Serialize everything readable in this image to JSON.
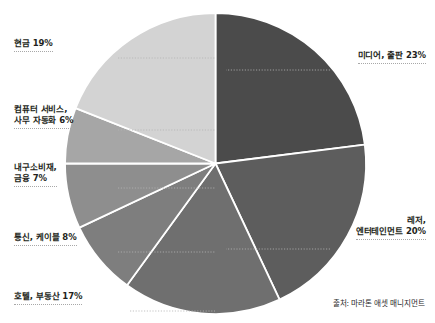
{
  "chart_data": {
    "type": "pie",
    "title": "",
    "subtitle": "",
    "xlabel": "",
    "ylabel": "",
    "legend_position": "callout-labels",
    "grid": false,
    "start_angle_deg": 0,
    "direction": "clockwise",
    "units": "percent",
    "categories": [
      "미디어, 출판",
      "레저, 엔터테인먼트",
      "호텔, 부동산",
      "통신, 케이블",
      "내구소비재, 금융",
      "컴퓨터 서비스, 사무 자동화",
      "현금"
    ],
    "values": [
      23,
      20,
      17,
      8,
      7,
      6,
      19
    ],
    "colors": [
      "#4b4b4b",
      "#5d5d5d",
      "#6f6f6f",
      "#7e7e7e",
      "#8e8e8e",
      "#a6a6a6",
      "#d3d3d3"
    ],
    "slice_separator_color": "#ffffff",
    "slices": [
      {
        "label": "미디어, 출판",
        "value": 23,
        "display": "미디어, 출판 23%",
        "color": "#4b4b4b"
      },
      {
        "label": "레저, 엔터테인먼트",
        "value": 20,
        "display": "레저, 엔터테인먼트 20%",
        "color": "#5d5d5d"
      },
      {
        "label": "호텔, 부동산",
        "value": 17,
        "display": "호텔, 부동산 17%",
        "color": "#6f6f6f"
      },
      {
        "label": "통신, 케이블",
        "value": 8,
        "display": "통신, 케이블 8%",
        "color": "#7e7e7e"
      },
      {
        "label": "내구소비재, 금융",
        "value": 7,
        "display": "내구소비재, 금융 7%",
        "color": "#8e8e8e"
      },
      {
        "label": "컴퓨터 서비스, 사무 자동화",
        "value": 6,
        "display": "컴퓨터 서비스, 사무 자동화 6%",
        "color": "#a6a6a6"
      },
      {
        "label": "현금",
        "value": 19,
        "display": "현금 19%",
        "color": "#d3d3d3"
      }
    ],
    "annotations": [
      "출처: 마라톤 애셋 매니지먼트"
    ]
  },
  "callouts": {
    "cash": {
      "line1": "현금 19%"
    },
    "computer_services": {
      "line1": "컴퓨터 서비스,",
      "line2": "사무 자동화 6%"
    },
    "durable_goods": {
      "line1": "내구소비재,",
      "line2": "금융 7%"
    },
    "telecom": {
      "line1": "통신, 케이블 8%"
    },
    "hotel_realestate": {
      "line1": "호텔, 부동산 17%"
    },
    "media_publishing": {
      "line1": "미디어, 출판 23%"
    },
    "leisure": {
      "line1": "레저,",
      "line2": "엔터테인먼트 20%"
    }
  },
  "source": {
    "text": "출처: 마라톤 애셋 매니지먼트"
  }
}
